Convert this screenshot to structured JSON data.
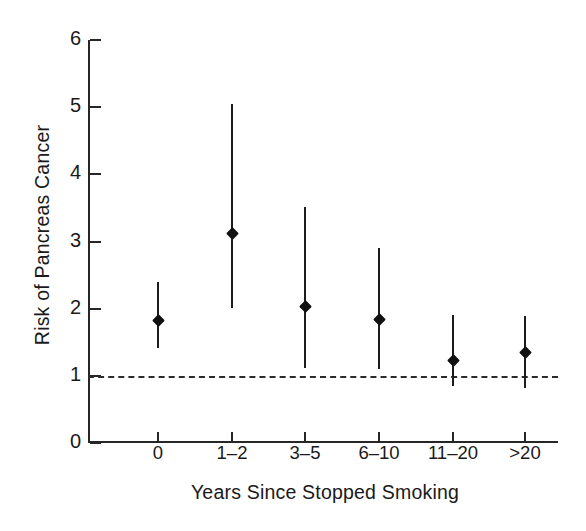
{
  "chart_data": {
    "type": "scatter",
    "title": "",
    "xlabel": "Years Since Stopped Smoking",
    "ylabel": "Risk of Pancreas Cancer",
    "categories": [
      "0",
      "1–2",
      "3–5",
      "6–10",
      "11–20",
      ">20"
    ],
    "values": [
      1.83,
      3.12,
      2.03,
      1.84,
      1.23,
      1.34
    ],
    "error_low": [
      1.42,
      2.01,
      1.12,
      1.1,
      0.85,
      0.82
    ],
    "error_high": [
      2.4,
      5.04,
      3.52,
      2.9,
      1.9,
      1.89
    ],
    "reference_line": 1.0,
    "reference_line_style": "dashed",
    "ylim": [
      0,
      6
    ],
    "yticks": [
      0,
      1,
      2,
      3,
      4,
      5,
      6
    ],
    "ytick_labels": [
      "0",
      "1",
      "2",
      "3",
      "4",
      "5",
      "6"
    ],
    "grid": false,
    "legend": null,
    "marker": "diamond",
    "series_name": "Relative risk with 95% confidence interval",
    "line_color": "#1c1c1c",
    "marker_color": "#111111",
    "background_color": "#ffffff"
  },
  "axes": {
    "y": {
      "label": "Risk of Pancreas Cancer",
      "ticks": [
        {
          "value": 0,
          "label": "0"
        },
        {
          "value": 1,
          "label": "1"
        },
        {
          "value": 2,
          "label": "2"
        },
        {
          "value": 3,
          "label": "3"
        },
        {
          "value": 4,
          "label": "4"
        },
        {
          "value": 5,
          "label": "5"
        },
        {
          "value": 6,
          "label": "6"
        }
      ]
    },
    "x": {
      "label": "Years Since Stopped Smoking",
      "ticks": [
        {
          "index": 0,
          "label": "0"
        },
        {
          "index": 1,
          "label": "1–2"
        },
        {
          "index": 2,
          "label": "3–5"
        },
        {
          "index": 3,
          "label": "6–10"
        },
        {
          "index": 4,
          "label": "11–20"
        },
        {
          "index": 5,
          "label": ">20"
        }
      ]
    }
  }
}
